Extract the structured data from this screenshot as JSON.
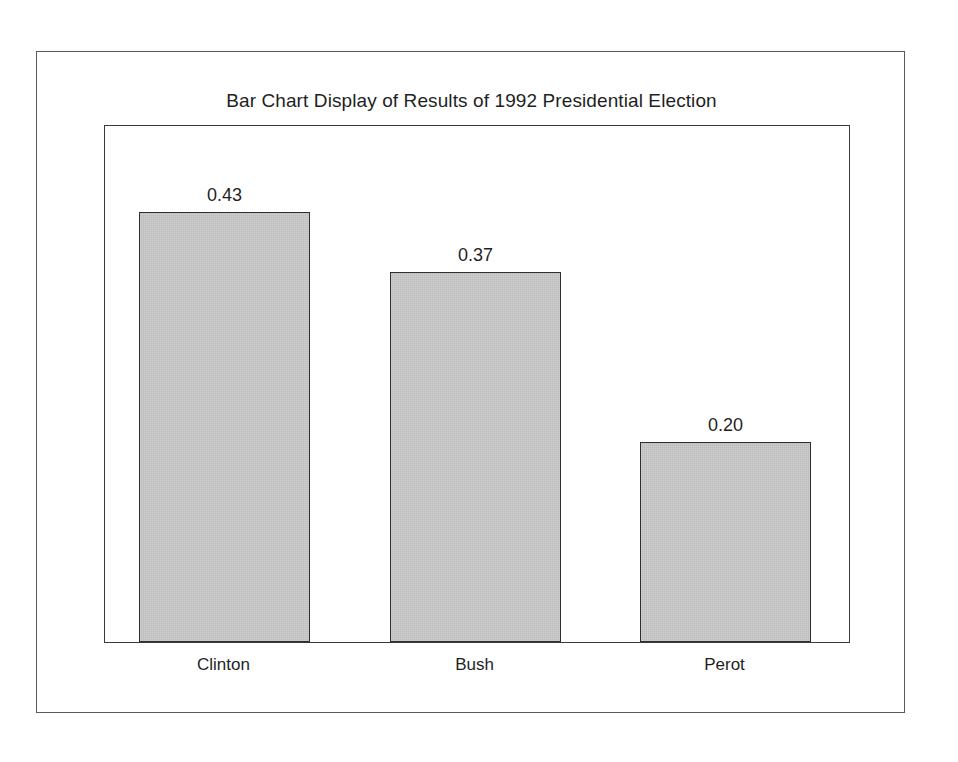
{
  "figure": {
    "background_color": "#ffffff",
    "border_color": "#555a5e",
    "plot_border_color": "#3a3a3a"
  },
  "chart_data": {
    "type": "bar",
    "title": "Bar Chart Display of Results of 1992 Presidential Election",
    "xlabel": "",
    "ylabel": "",
    "categories": [
      "Clinton",
      "Bush",
      "Perot"
    ],
    "values": [
      0.43,
      0.37,
      0.2
    ],
    "value_labels": [
      "0.43",
      "0.37",
      "0.20"
    ],
    "ylim": [
      0,
      0.5175
    ],
    "grid": false,
    "legend": null,
    "bar_color": "#c3c3c3",
    "bar_edge_color": "#2e2e2e",
    "axis_tick_labels": []
  }
}
